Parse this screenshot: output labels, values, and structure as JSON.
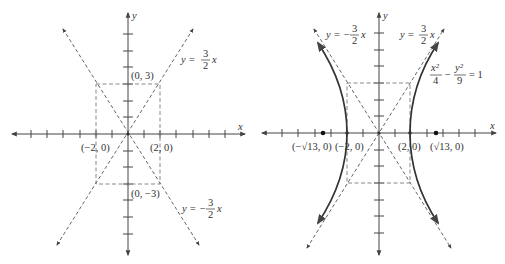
{
  "panels": [
    {
      "id": "asymptotes",
      "axis_labels": {
        "x": "x",
        "y": "y"
      },
      "points": {
        "top": "(0, 3)",
        "bottom": "(0, −3)",
        "left": "(−2, 0)",
        "right": "(2, 0)"
      },
      "asymptote_pos": {
        "lhs": "y =",
        "num": "3",
        "den": "2",
        "var": "x"
      },
      "asymptote_neg": {
        "lhs": "y = −",
        "num": "3",
        "den": "2",
        "var": "x"
      }
    },
    {
      "id": "hyperbola",
      "axis_labels": {
        "x": "x",
        "y": "y"
      },
      "points": {
        "vertex_left": "(−2, 0)",
        "vertex_right": "(2, 0)",
        "focus_left": "(−√13, 0)",
        "focus_right": "(√13, 0)"
      },
      "asymptote_pos": {
        "lhs": "y =",
        "num": "3",
        "den": "2",
        "var": "x"
      },
      "asymptote_neg": {
        "lhs": "y = −",
        "num": "3",
        "den": "2",
        "var": "x"
      },
      "equation": {
        "t1_num": "x²",
        "t1_den": "4",
        "minus": "−",
        "t2_num": "y²",
        "t2_den": "9",
        "rhs": "= 1"
      }
    }
  ],
  "colors": {
    "axis": "#444444",
    "curve": "#333333",
    "dashed": "#555555",
    "box": "#888888"
  }
}
